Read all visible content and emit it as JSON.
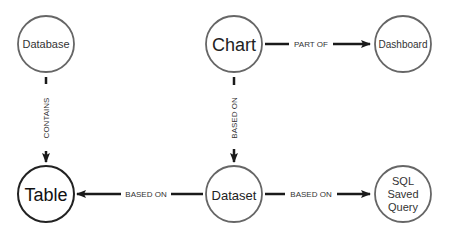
{
  "diagram": {
    "nodes": {
      "database": {
        "label": "Database",
        "x": 46,
        "y": 44,
        "r": 28,
        "font_size": 11,
        "stroke": "#666666",
        "text_color": "#333333"
      },
      "chart": {
        "label": "Chart",
        "x": 234,
        "y": 44,
        "r": 28,
        "font_size": 18,
        "stroke": "#666666",
        "text_color": "#222222"
      },
      "dashboard": {
        "label": "Dashboard",
        "x": 403,
        "y": 44,
        "r": 28,
        "font_size": 10,
        "stroke": "#666666",
        "text_color": "#333333"
      },
      "table": {
        "label": "Table",
        "x": 46,
        "y": 194,
        "r": 28,
        "font_size": 18,
        "stroke": "#222222",
        "text_color": "#111111"
      },
      "dataset": {
        "label": "Dataset",
        "x": 234,
        "y": 194,
        "r": 28,
        "font_size": 13,
        "stroke": "#666666",
        "text_color": "#222222"
      },
      "sql_saved_query": {
        "label_lines": [
          "SQL",
          "Saved",
          "Query"
        ],
        "x": 403,
        "y": 194,
        "r": 28,
        "font_size": 11,
        "stroke": "#666666",
        "text_color": "#333333"
      }
    },
    "edges": {
      "database_contains_table": {
        "label": "CONTAINS",
        "from": "database",
        "to": "table",
        "orientation": "vertical"
      },
      "chart_part_of_dashboard": {
        "label": "PART OF",
        "from": "chart",
        "to": "dashboard",
        "orientation": "horizontal"
      },
      "chart_based_on_dataset": {
        "label": "BASED ON",
        "from": "chart",
        "to": "dataset",
        "orientation": "vertical"
      },
      "dataset_based_on_table": {
        "label": "BASED ON",
        "from": "dataset",
        "to": "table",
        "orientation": "horizontal"
      },
      "dataset_based_on_sql": {
        "label": "BASED ON",
        "from": "dataset",
        "to": "sql_saved_query",
        "orientation": "horizontal"
      }
    },
    "edge_color": "#1a1a1a",
    "edge_label_color": "#333333"
  }
}
